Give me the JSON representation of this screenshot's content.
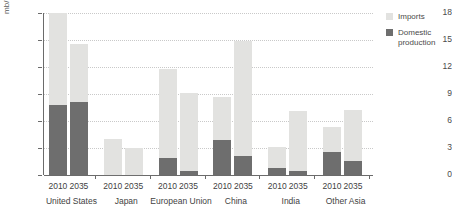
{
  "chart_data": {
    "type": "bar",
    "subtype": "stacked",
    "title": "",
    "xlabel": "",
    "ylabel": "mb/d",
    "ylim": [
      0,
      18
    ],
    "yticks": [
      0,
      3,
      6,
      9,
      12,
      15,
      18
    ],
    "ytick_labels": [
      "0",
      "3",
      "6",
      "9",
      "12",
      "15",
      "18"
    ],
    "grid": true,
    "legend_position": "right",
    "series": [
      {
        "name": "Imports",
        "color": "#e2e2e0",
        "values": [
          10.2,
          6.5,
          4.0,
          2.9,
          9.9,
          8.7,
          4.8,
          12.8,
          2.3,
          6.6,
          2.7,
          5.6
        ]
      },
      {
        "name": "Domestic production",
        "color": "#6e6e6e",
        "values": [
          7.8,
          8.1,
          0.05,
          0.05,
          1.9,
          0.4,
          3.9,
          2.1,
          0.8,
          0.5,
          2.6,
          1.6
        ]
      }
    ],
    "totals": [
      18.0,
      14.6,
      4.05,
      2.95,
      11.8,
      9.1,
      13.8,
      14.9,
      3.1,
      7.1,
      5.3,
      7.2
    ],
    "groups": [
      {
        "label": "United States",
        "years": [
          "2010",
          "2035"
        ],
        "bars": [
          {
            "year": "2010",
            "imports": 10.2,
            "domestic": 7.8,
            "total": 18.0
          },
          {
            "year": "2035",
            "imports": 6.5,
            "domestic": 8.1,
            "total": 14.6
          }
        ]
      },
      {
        "label": "Japan",
        "years": [
          "2010",
          "2035"
        ],
        "bars": [
          {
            "year": "2010",
            "imports": 4.0,
            "domestic": 0.05,
            "total": 4.05
          },
          {
            "year": "2035",
            "imports": 2.9,
            "domestic": 0.05,
            "total": 2.95
          }
        ]
      },
      {
        "label": "European Union",
        "years": [
          "2010",
          "2035"
        ],
        "bars": [
          {
            "year": "2010",
            "imports": 9.9,
            "domestic": 1.9,
            "total": 11.8
          },
          {
            "year": "2035",
            "imports": 8.7,
            "domestic": 0.4,
            "total": 9.1
          }
        ]
      },
      {
        "label": "China",
        "years": [
          "2010",
          "2035"
        ],
        "bars": [
          {
            "year": "2010",
            "imports": 4.8,
            "domestic": 3.9,
            "total": 8.7
          },
          {
            "year": "2035",
            "imports": 12.8,
            "domestic": 2.1,
            "total": 14.9
          }
        ]
      },
      {
        "label": "India",
        "years": [
          "2010",
          "2035"
        ],
        "bars": [
          {
            "year": "2010",
            "imports": 2.3,
            "domestic": 0.8,
            "total": 3.1
          },
          {
            "year": "2035",
            "imports": 6.6,
            "domestic": 0.5,
            "total": 7.1
          }
        ]
      },
      {
        "label": "Other Asia",
        "years": [
          "2010",
          "2035"
        ],
        "bars": [
          {
            "year": "2010",
            "imports": 2.7,
            "domestic": 2.6,
            "total": 5.3
          },
          {
            "year": "2035",
            "imports": 5.6,
            "domestic": 1.6,
            "total": 7.2
          }
        ]
      }
    ],
    "legend": [
      {
        "label": "Imports",
        "color": "#e2e2e0"
      },
      {
        "label": "Domestic production",
        "color": "#6e6e6e"
      }
    ]
  },
  "legend_display": {
    "imports": "Imports",
    "domestic_line1": "Domestic",
    "domestic_line2": "production"
  }
}
